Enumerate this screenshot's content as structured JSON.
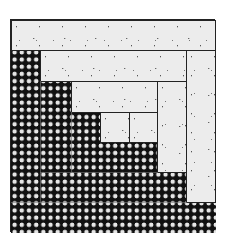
{
  "image": {
    "subject": "log-cabin-quilt-block",
    "colors": {
      "dark_fabric": "#111111",
      "dark_fabric_dots": "#e6e6e6",
      "light_fabric": "#ececec",
      "seam": "#222222",
      "background": "#ffffff"
    },
    "patches": [
      {
        "name": "dark-fill",
        "tone": "dark",
        "x": 0,
        "y": 0,
        "w": 205,
        "h": 213
      },
      {
        "name": "light-strip-top-1",
        "tone": "light",
        "x": 0,
        "y": 0,
        "w": 205,
        "h": 31
      },
      {
        "name": "light-strip-right-1",
        "tone": "light",
        "x": 175,
        "y": 30,
        "w": 30,
        "h": 153
      },
      {
        "name": "light-strip-top-2",
        "tone": "light",
        "x": 29,
        "y": 30,
        "w": 147,
        "h": 32
      },
      {
        "name": "light-strip-right-2",
        "tone": "light",
        "x": 146,
        "y": 61,
        "w": 30,
        "h": 92
      },
      {
        "name": "light-strip-top-3",
        "tone": "light",
        "x": 60,
        "y": 61,
        "w": 87,
        "h": 32
      },
      {
        "name": "light-strip-right-3",
        "tone": "light",
        "x": 118,
        "y": 92,
        "w": 29,
        "h": 31
      },
      {
        "name": "light-center",
        "tone": "light",
        "x": 89,
        "y": 92,
        "w": 30,
        "h": 31
      }
    ],
    "seams": [
      {
        "name": "dark-seam-col-1",
        "x": 29,
        "y": 61,
        "w": 1,
        "h": 122
      },
      {
        "name": "dark-seam-col-2",
        "x": 60,
        "y": 92,
        "w": 1,
        "h": 61
      },
      {
        "name": "dark-seam-row-1",
        "x": 29,
        "y": 152,
        "w": 118,
        "h": 1
      },
      {
        "name": "dark-seam-row-2",
        "x": 0,
        "y": 182,
        "w": 176,
        "h": 1
      }
    ]
  }
}
